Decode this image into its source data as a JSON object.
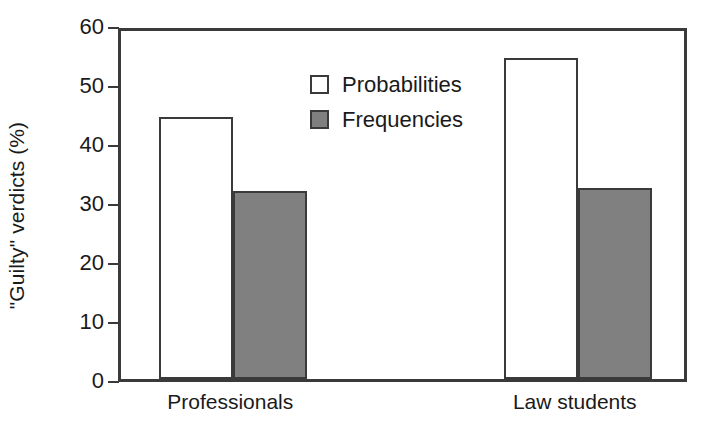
{
  "chart_data": {
    "type": "bar",
    "title": "",
    "xlabel": "",
    "ylabel": "\"Guilty\" verdicts (%)",
    "categories": [
      "Professionals",
      "Law students"
    ],
    "series": [
      {
        "name": "Probabilities",
        "values": [
          44.4,
          54.4
        ],
        "fill": "#ffffff",
        "edge": "#3a3a3a"
      },
      {
        "name": "Frequencies",
        "values": [
          31.8,
          32.4
        ],
        "fill": "#808080",
        "edge": "#3a3a3a"
      }
    ],
    "ylim": [
      0,
      60
    ],
    "ytick_labels": [
      "0",
      "10",
      "20",
      "30",
      "40",
      "50",
      "60"
    ],
    "ytick_values": [
      0,
      10,
      20,
      30,
      40,
      50,
      60
    ],
    "grid": false,
    "legend_position": "upper-left-inside"
  },
  "axis": {
    "y_title": "\"Guilty\" verdicts (%)"
  },
  "legend": {
    "entries": [
      {
        "label": "Probabilities"
      },
      {
        "label": "Frequencies"
      }
    ]
  },
  "colors": {
    "axis": "#3a3a3a",
    "text": "#1a1a1a",
    "bar_open": "#ffffff",
    "bar_filled": "#808080",
    "background": "#ffffff"
  }
}
